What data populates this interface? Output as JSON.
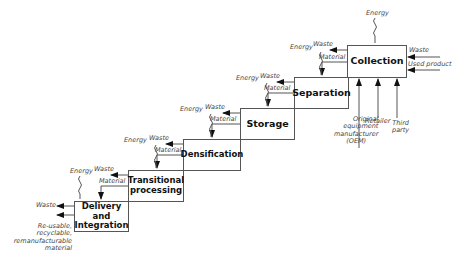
{
  "diagram": {
    "type": "stepped process flow",
    "stages": [
      {
        "label": "Collection"
      },
      {
        "label": "Separation"
      },
      {
        "label": "Storage"
      },
      {
        "label": "Densification"
      },
      {
        "label": "Transitional processing",
        "line1": "Transitional",
        "line2": "processing"
      },
      {
        "label": "Delivery and Integration",
        "line1": "Delivery and",
        "line2": "Integration"
      }
    ],
    "flow_labels": {
      "energy": "Energy",
      "waste": "Waste",
      "material": "Material",
      "used_product": "Used product"
    },
    "sources": {
      "oem_line1": "Original",
      "oem_line2": "equipment",
      "oem_line3": "manufacturer",
      "oem_line4": "(OEM)",
      "retailer": "Retailer",
      "third_party_line1": "Third",
      "third_party_line2": "party"
    },
    "output": {
      "line1": "Re-usable,",
      "line2": "recyclable,",
      "line3": "remanufacturable",
      "line4": "material"
    },
    "colors": {
      "line": "#555555",
      "arrow": "#111111",
      "text": "#111111",
      "label": "#444444"
    }
  }
}
